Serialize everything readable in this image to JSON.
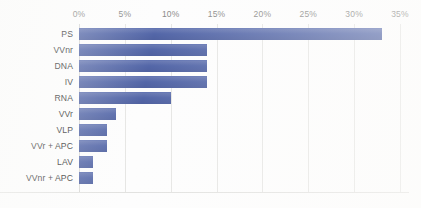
{
  "chart_data": {
    "type": "bar",
    "orientation": "horizontal",
    "title": "",
    "subtitle": "",
    "xlabel": "",
    "ylabel": "",
    "xlim": [
      0,
      35
    ],
    "grid": true,
    "legend": false,
    "legend_position": "none",
    "bar_color": "#5366a8",
    "gridline_color": "#e6e6e4",
    "tick_label_color": "#8a8a88",
    "category_label_color": "#2e2e2e",
    "tick_suffix": "%",
    "xticks": [
      0,
      5,
      10,
      15,
      20,
      25,
      30,
      35
    ],
    "xtick_labels": [
      "0%",
      "5%",
      "10%",
      "15%",
      "20%",
      "25%",
      "30%",
      "35%"
    ],
    "categories": [
      "PS",
      "VVnr",
      "DNA",
      "IV",
      "RNA",
      "VVr",
      "VLP",
      "VVr + APC",
      "LAV",
      "VVnr + APC"
    ],
    "values": [
      33.0,
      14.0,
      14.0,
      14.0,
      10.0,
      4.0,
      3.0,
      3.0,
      1.5,
      1.5
    ],
    "value_labels": [
      "33%",
      "14%",
      "14%",
      "14%",
      "10%",
      "4%",
      "3%",
      "3%",
      "1.5%",
      "1.5%"
    ],
    "annotations": []
  }
}
